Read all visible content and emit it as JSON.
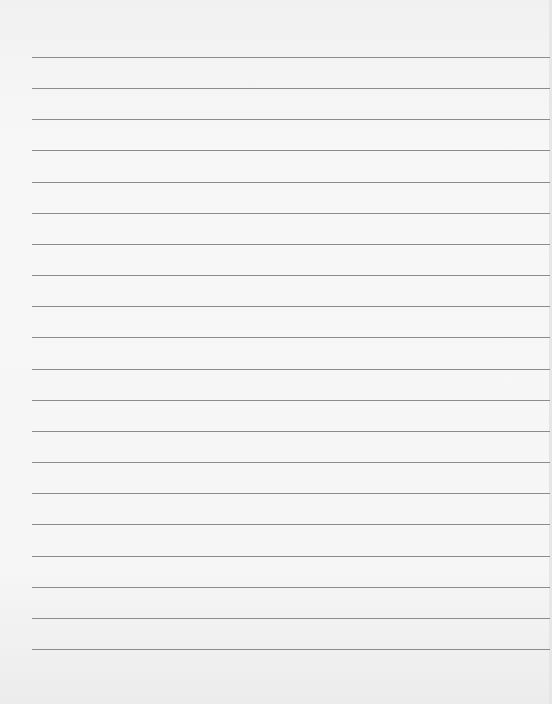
{
  "page": {
    "type": "lined-paper",
    "line_count": 20,
    "first_line_y": 57,
    "line_spacing": 31.16,
    "line_left": 32,
    "line_color": "#8c8c8c",
    "background_color": "#f5f5f5"
  }
}
